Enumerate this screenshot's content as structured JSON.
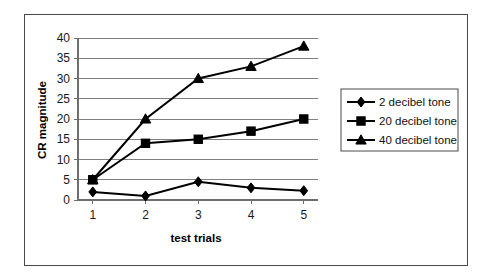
{
  "chart_data": {
    "type": "line",
    "title": "",
    "xlabel": "test trials",
    "ylabel": "CR magnitude",
    "x": [
      1,
      2,
      3,
      4,
      5
    ],
    "categories": [
      "1",
      "2",
      "3",
      "4",
      "5"
    ],
    "xtick_labels": [
      "1",
      "2",
      "3",
      "4",
      "5"
    ],
    "ytick_labels": [
      "0",
      "5",
      "10",
      "15",
      "20",
      "25",
      "30",
      "35",
      "40"
    ],
    "ylim": [
      0,
      40
    ],
    "ytick_step": 5,
    "grid": true,
    "grid_axis": "y",
    "legend_position": "right",
    "series": [
      {
        "name": "2 decibel tone",
        "marker": "diamond",
        "color": "#000000",
        "values": [
          2,
          1,
          4.5,
          3,
          2.3
        ]
      },
      {
        "name": "20 decibel tone",
        "marker": "square",
        "color": "#000000",
        "values": [
          5,
          14,
          15,
          17,
          20
        ]
      },
      {
        "name": "40 decibel tone",
        "marker": "triangle",
        "color": "#000000",
        "values": [
          5,
          20,
          30,
          33,
          38
        ]
      }
    ]
  },
  "legend": {
    "entries": [
      {
        "label": "2 decibel tone",
        "marker": "diamond"
      },
      {
        "label": "20 decibel tone",
        "marker": "square"
      },
      {
        "label": "40 decibel tone",
        "marker": "triangle"
      }
    ]
  },
  "axes": {
    "y_title": "CR magnitude",
    "x_title": "test trials"
  }
}
